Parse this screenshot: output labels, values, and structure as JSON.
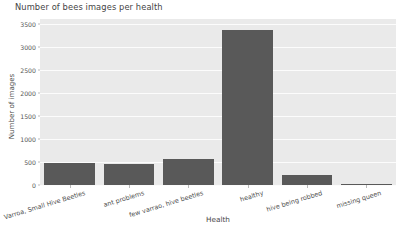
{
  "chart_data": {
    "type": "bar",
    "title": "Number of bees images per health",
    "xlabel": "Health",
    "ylabel": "Number of images",
    "categories": [
      "Varroa, Small Hive Beetles",
      "ant problems",
      "few varrao, hive beetles",
      "healthy",
      "hive being robbed",
      "missing queen"
    ],
    "values": [
      472,
      457,
      561,
      3351,
      220,
      10
    ],
    "ylim": [
      0,
      3600
    ],
    "yticks": [
      0,
      500,
      1000,
      1500,
      2000,
      2500,
      3000,
      3500
    ],
    "ytick_labels": [
      "0",
      "500",
      "1000",
      "1500",
      "2000",
      "2500",
      "3000",
      "3500"
    ],
    "grid": true,
    "legend": null,
    "bar_color": "#595959",
    "plot_background": "#eaeaea",
    "grid_color": "#fcfcfc",
    "figure_background": "#ffffff"
  }
}
